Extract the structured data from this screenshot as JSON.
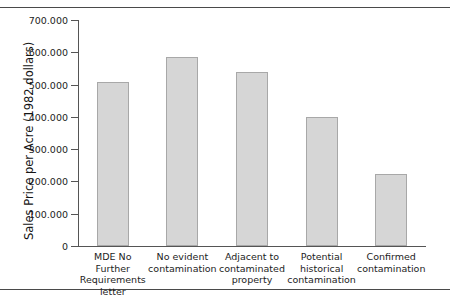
{
  "chart_data": {
    "type": "bar",
    "title": "",
    "xlabel": "",
    "ylabel": "Sales Price per Acre (1982 dollars)",
    "ylim": [
      0,
      700000
    ],
    "grid": false,
    "legend": null,
    "categories": [
      "MDE No Further\nRequirements\nletter",
      "No evident\ncontamination",
      "Adjacent to\ncontaminated\nproperty",
      "Potential\nhistorical\ncontamination",
      "Confirmed\ncontamination"
    ],
    "values": [
      508000,
      585000,
      540000,
      399000,
      224000
    ],
    "ytick_labels": [
      "0",
      "100.000",
      "200.000",
      "300.000",
      "400.000",
      "500.000",
      "600.000",
      "700.000"
    ],
    "ytick_values": [
      0,
      100000,
      200000,
      300000,
      400000,
      500000,
      600000,
      700000
    ],
    "bar_color": "#d6d6d6",
    "bar_border_color": "#a8a8a8",
    "axis_color": "#555555"
  }
}
